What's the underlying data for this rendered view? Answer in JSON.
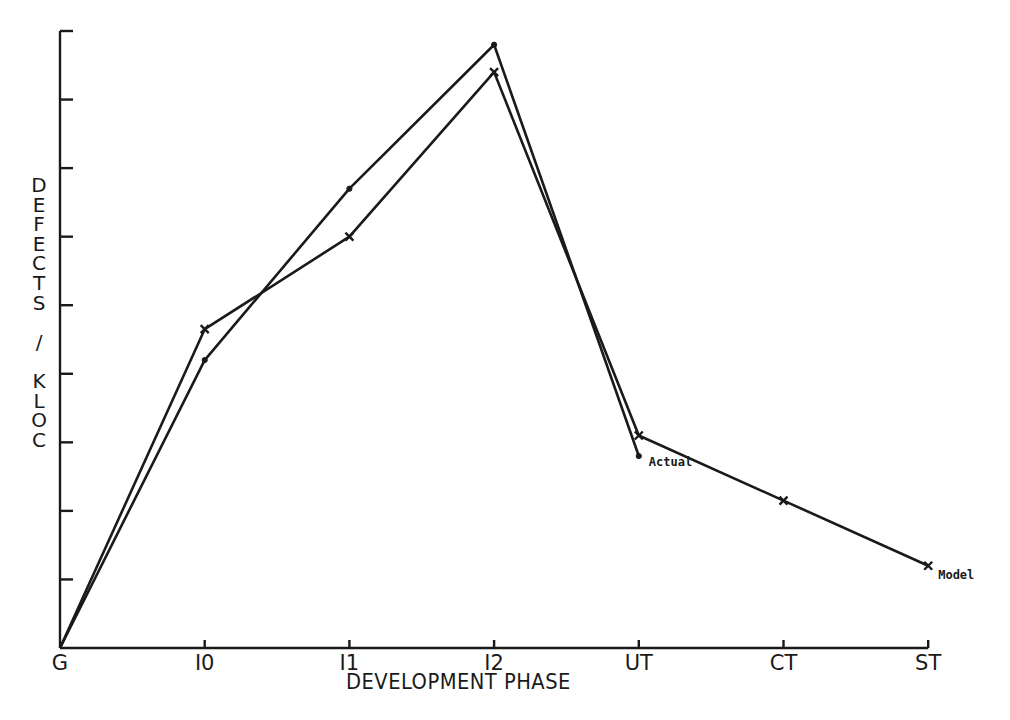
{
  "chart_data": {
    "type": "line",
    "title": "",
    "xlabel": "DEVELOPMENT PHASE",
    "ylabel": "DEFECTS / KLOC",
    "categories": [
      "G",
      "I0",
      "I1",
      "I2",
      "UT",
      "CT",
      "ST"
    ],
    "series": [
      {
        "name": "Actual",
        "marker": "dot",
        "values": [
          0,
          4.2,
          6.7,
          8.8,
          2.8,
          null,
          null
        ]
      },
      {
        "name": "Model",
        "marker": "x",
        "values": [
          0,
          4.65,
          6.0,
          8.4,
          3.1,
          2.15,
          1.2
        ]
      }
    ],
    "ylim": [
      0,
      9
    ],
    "yticks_count": 9,
    "ytick_labels_shown": false,
    "grid": false,
    "legend": "inline annotations: 'Actual' at UT, 'Model' at ST",
    "annotations": [
      {
        "text": "Actual",
        "at": "UT"
      },
      {
        "text": "Model",
        "at": "ST"
      }
    ]
  },
  "axis": {
    "ylabel_stacked": "D\nE\nF\nE\nC\nT\nS\n \n/\n \nK\nL\nO\nC",
    "xlabel": "DEVELOPMENT PHASE"
  },
  "style": {
    "ink": "#1a1a1a",
    "background": "#ffffff"
  }
}
